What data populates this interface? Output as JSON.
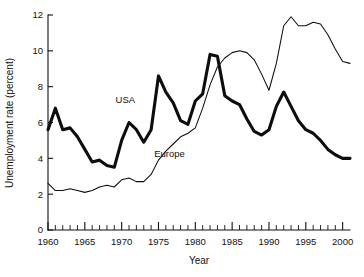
{
  "chart_data": {
    "type": "line",
    "title": "",
    "xlabel": "Year",
    "ylabel": "Unemployment rate (percent)",
    "xlim": [
      1960,
      2001
    ],
    "ylim": [
      0,
      12
    ],
    "xticks": [
      1960,
      1965,
      1970,
      1975,
      1980,
      1985,
      1990,
      1995,
      2000
    ],
    "xtick_labels": [
      "1960",
      "1965",
      "1970",
      "1975",
      "1980",
      "1985",
      "1990",
      "1995",
      "2000"
    ],
    "yticks": [
      0,
      2,
      4,
      6,
      8,
      10,
      12
    ],
    "ytick_labels": [
      "0",
      "2",
      "4",
      "6",
      "8",
      "10",
      "12"
    ],
    "minor_xtick_interval": 1,
    "grid": false,
    "legend": "inline-annotations",
    "x": [
      1960,
      1961,
      1962,
      1963,
      1964,
      1965,
      1966,
      1967,
      1968,
      1969,
      1970,
      1971,
      1972,
      1973,
      1974,
      1975,
      1976,
      1977,
      1978,
      1979,
      1980,
      1981,
      1982,
      1983,
      1984,
      1985,
      1986,
      1987,
      1988,
      1989,
      1990,
      1991,
      1992,
      1993,
      1994,
      1995,
      1996,
      1997,
      1998,
      1999,
      2000,
      2001
    ],
    "series": [
      {
        "name": "USA",
        "style": "thick-black-line",
        "label_position": {
          "x": 1970.5,
          "y": 7.1
        },
        "values": [
          5.6,
          6.8,
          5.6,
          5.7,
          5.2,
          4.5,
          3.8,
          3.9,
          3.6,
          3.5,
          5.0,
          6.0,
          5.6,
          4.9,
          5.6,
          8.6,
          7.7,
          7.1,
          6.1,
          5.9,
          7.2,
          7.6,
          9.8,
          9.7,
          7.5,
          7.2,
          7.0,
          6.2,
          5.5,
          5.3,
          5.6,
          6.9,
          7.7,
          6.9,
          6.1,
          5.6,
          5.4,
          5.0,
          4.5,
          4.2,
          4.0,
          4.0
        ]
      },
      {
        "name": "Europe",
        "style": "thin-black-line",
        "label_position": {
          "x": 1976.5,
          "y": 4.1
        },
        "values": [
          2.6,
          2.2,
          2.2,
          2.3,
          2.2,
          2.1,
          2.2,
          2.4,
          2.5,
          2.4,
          2.8,
          2.9,
          2.7,
          2.7,
          3.1,
          3.9,
          4.4,
          4.8,
          5.2,
          5.4,
          5.7,
          6.8,
          8.1,
          9.1,
          9.6,
          9.9,
          10.0,
          9.9,
          9.5,
          8.7,
          7.8,
          9.3,
          11.4,
          11.9,
          11.4,
          11.4,
          11.6,
          11.5,
          10.9,
          10.1,
          9.4,
          9.3
        ]
      }
    ]
  },
  "figure": {
    "bottom_caption_fragment": ""
  }
}
